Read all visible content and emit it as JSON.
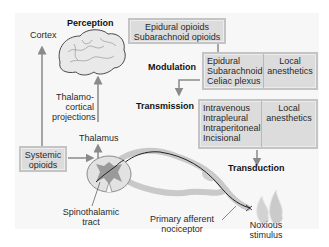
{
  "diagram": {
    "title_labels": {
      "perception": "Perception",
      "modulation": "Modulation",
      "transmission": "Transmission",
      "transduction": "Transduction"
    },
    "anatomy_labels": {
      "cortex": "Cortex",
      "thalamocortical_line1": "Thalamo-",
      "thalamocortical_line2": "cortical",
      "thalamocortical_line3": "projections",
      "thalamus": "Thalamus",
      "spinothalamic_line1": "Spinothalamic",
      "spinothalamic_line2": "tract",
      "afferent_line1": "Primary afferent",
      "afferent_line2": "nociceptor",
      "noxious_line1": "Noxious",
      "noxious_line2": "stimulus"
    },
    "boxes": {
      "top_opioids": {
        "line1": "Epidural opioids",
        "line2": "Subarachnoid opioids"
      },
      "modulation": {
        "left": [
          "Epidural",
          "Subarachnoid",
          "Celiac plexus"
        ],
        "right": [
          "Local",
          "anesthetics"
        ]
      },
      "transmission": {
        "left": [
          "Intravenous",
          "Intrapleural",
          "Intraperitoneal",
          "Incisional"
        ],
        "right": [
          "Local",
          "anesthetics"
        ]
      },
      "systemic": {
        "line1": "Systemic",
        "line2": "opioids"
      }
    },
    "icons": [
      "brain-icon",
      "spinal-cord-cross-section-icon",
      "nerve-fiber-icon",
      "flame-icon",
      "arrow-icon"
    ],
    "colors": {
      "background": "#ffffff",
      "panel": "#f7f7f7",
      "box_fill": "#dcdcdc",
      "box_border": "#c4c4c4",
      "arrow": "#888888"
    }
  }
}
